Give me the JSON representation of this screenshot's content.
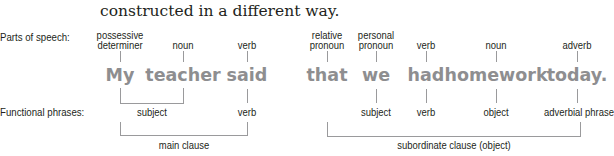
{
  "intro_text": "constructed in a different way.",
  "row_labels": {
    "parts_of_speech": "Parts of speech:",
    "functional_phrases": "Functional phrases:"
  },
  "words": [
    {
      "text": "My",
      "pos": [
        "possessive",
        "determiner"
      ]
    },
    {
      "text": "teacher",
      "pos": [
        "noun"
      ]
    },
    {
      "text": "said",
      "pos": [
        "verb"
      ]
    },
    {
      "text": "that",
      "pos": [
        "relative",
        "pronoun"
      ]
    },
    {
      "text": "we",
      "pos": [
        "personal",
        "pronoun"
      ]
    },
    {
      "text": "had",
      "pos": [
        "verb"
      ]
    },
    {
      "text": "homework",
      "pos": [
        "noun"
      ]
    },
    {
      "text": "today.",
      "pos": [
        "adverb"
      ]
    }
  ],
  "functional_phrases": [
    {
      "label": "subject",
      "spans": [
        "My",
        "teacher"
      ]
    },
    {
      "label": "verb",
      "spans": [
        "said"
      ]
    },
    {
      "label": "subject",
      "spans": [
        "we"
      ]
    },
    {
      "label": "verb",
      "spans": [
        "had"
      ]
    },
    {
      "label": "object",
      "spans": [
        "homework"
      ]
    },
    {
      "label": "adverbial phrase",
      "spans": [
        "today."
      ]
    }
  ],
  "clauses": [
    {
      "label": "main clause",
      "spans": [
        "My",
        "said"
      ]
    },
    {
      "label": "subordinate clause (object)",
      "spans": [
        "that",
        "today."
      ]
    }
  ],
  "colors": {
    "word_gray": "#8e8e90",
    "line_gray": "#9a9a9c",
    "text": "#231f20"
  }
}
